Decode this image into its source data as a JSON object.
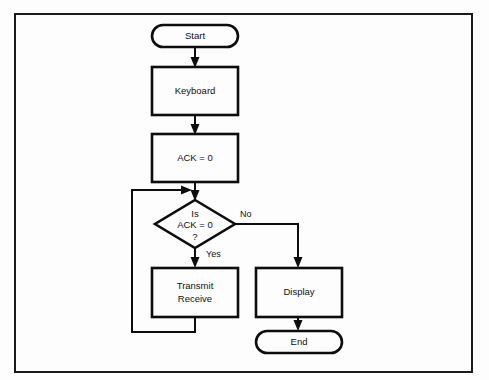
{
  "diagram": {
    "colors": {
      "stroke": "#0d0d0d",
      "fill": "#fdfdfd",
      "frame": "#1a1a1a",
      "background": "#fdfdfd"
    },
    "nodes": {
      "start": {
        "label": "Start",
        "shape": "terminator"
      },
      "keyboard": {
        "label": "Keyboard",
        "shape": "process"
      },
      "ack_init": {
        "label": "ACK = 0",
        "shape": "process"
      },
      "decision": {
        "shape": "decision",
        "line1": "Is",
        "line2": "ACK = 0",
        "line3": "?"
      },
      "transmit_receive": {
        "shape": "process",
        "line1": "Transmit",
        "line2": "Receive"
      },
      "display": {
        "label": "Display",
        "shape": "process"
      },
      "end": {
        "label": "End",
        "shape": "terminator"
      }
    },
    "edges": {
      "yes_label": "Yes",
      "no_label": "No"
    }
  }
}
